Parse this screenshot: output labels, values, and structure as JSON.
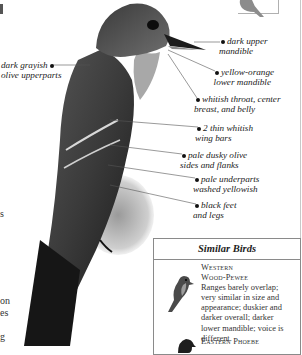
{
  "callouts": [
    {
      "id": "dark-upper-mandible",
      "lines": [
        "dark upper",
        "mandible"
      ]
    },
    {
      "id": "dark-grayish-olive-upperparts",
      "lines": [
        "dark grayish",
        "olive upperparts"
      ]
    },
    {
      "id": "yellow-orange-lower-mandible",
      "lines": [
        "yellow-orange",
        "lower mandible"
      ]
    },
    {
      "id": "whitish-throat",
      "lines": [
        "whitish throat, center",
        "breast, and belly"
      ]
    },
    {
      "id": "wing-bars",
      "lines": [
        "2 thin whitish",
        "wing bars"
      ]
    },
    {
      "id": "sides-flanks",
      "lines": [
        "pale dusky olive",
        "sides and flanks"
      ]
    },
    {
      "id": "underparts",
      "lines": [
        "pale underparts",
        "washed yellowish"
      ]
    },
    {
      "id": "feet-legs",
      "lines": [
        "black feet",
        "and legs"
      ]
    }
  ],
  "left_text_fragments": [
    "s",
    "on",
    "es",
    "g"
  ],
  "similar_birds": {
    "title": "Similar Birds",
    "entries": [
      {
        "name_line1": "Western",
        "name_line2": "Wood-Pewee",
        "description_lines": [
          "Ranges barely overlap;",
          "very similar in size and",
          "appearance; duskier and",
          "darker overall; darker",
          "lower mandible; voice is",
          "different."
        ]
      },
      {
        "name_line1": "Eastern Phoebe"
      }
    ]
  },
  "colors": {
    "box_border": "#8a8a8a",
    "text": "#222222",
    "bird_dark": "#2b2b2b",
    "bird_mid": "#6a6a6a"
  }
}
